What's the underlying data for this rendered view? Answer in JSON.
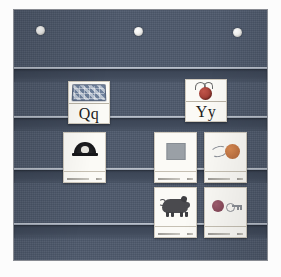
{
  "scene": {
    "name": "classroom-pocket-chart",
    "background_color": "#fcfcfc",
    "chart_color": "#4d586b",
    "pocket_lip_color": "#cfd4db",
    "pocket_shelf_color": "#3a4454"
  },
  "chart": {
    "grommets": [
      {
        "name": "grommet-left"
      },
      {
        "name": "grommet-center"
      },
      {
        "name": "grommet-right"
      }
    ],
    "pockets": [
      {
        "name": "pocket-row-1"
      },
      {
        "name": "pocket-row-2"
      },
      {
        "name": "pocket-row-3"
      },
      {
        "name": "pocket-row-4"
      }
    ]
  },
  "cards": {
    "row1": [
      {
        "id": "card-letter-q",
        "type": "letter-card",
        "caption": "Qq",
        "picture": "quilt",
        "picture_color": "#8795ab"
      },
      {
        "id": "card-letter-y",
        "type": "letter-card",
        "caption": "Yy",
        "picture": "yo-yo",
        "picture_color": "#8d2f28"
      }
    ],
    "row2": [
      {
        "id": "card-picture-umbrella",
        "type": "picture-card",
        "caption": "",
        "picture": "dark-dome",
        "picture_color": "#17171a"
      },
      {
        "id": "card-picture-square",
        "type": "picture-card",
        "caption": "",
        "picture": "gray-square",
        "picture_color": "#9aa0a6"
      },
      {
        "id": "card-picture-orange",
        "type": "picture-card",
        "caption": "",
        "picture": "orange-circle",
        "picture_color": "#b0663a"
      }
    ],
    "row3": [
      {
        "id": "card-picture-pig",
        "type": "picture-card",
        "caption": "",
        "picture": "pig",
        "picture_color": "#4a4a4e"
      },
      {
        "id": "card-picture-key",
        "type": "picture-card",
        "caption": "",
        "picture": "ball-and-key",
        "picture_color": "#7d4152"
      }
    ]
  }
}
